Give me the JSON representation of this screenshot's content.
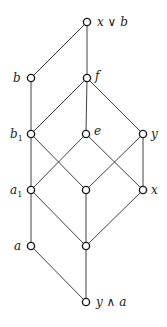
{
  "diagram": {
    "type": "hasse-diagram",
    "nodes": [
      {
        "id": "xvb",
        "label": "x ∨ b",
        "x": 87,
        "y": 22,
        "label_side": "right"
      },
      {
        "id": "b",
        "label": "b",
        "x": 31,
        "y": 78,
        "label_side": "left"
      },
      {
        "id": "f",
        "label": "f",
        "x": 87,
        "y": 78,
        "label_side": "right"
      },
      {
        "id": "b1",
        "label": "b",
        "label_sub": "1",
        "x": 31,
        "y": 134,
        "label_side": "left"
      },
      {
        "id": "e",
        "label": "e",
        "x": 86,
        "y": 134,
        "label_side": "right"
      },
      {
        "id": "y",
        "label": "y",
        "x": 143,
        "y": 134,
        "label_side": "right"
      },
      {
        "id": "a1",
        "label": "a",
        "label_sub": "1",
        "x": 31,
        "y": 190,
        "label_side": "left"
      },
      {
        "id": "m",
        "label": "",
        "x": 86,
        "y": 190,
        "label_side": "none"
      },
      {
        "id": "x",
        "label": "x",
        "x": 143,
        "y": 190,
        "label_side": "right"
      },
      {
        "id": "a",
        "label": "a",
        "x": 31,
        "y": 246,
        "label_side": "left"
      },
      {
        "id": "n",
        "label": "",
        "x": 86,
        "y": 246,
        "label_side": "none"
      },
      {
        "id": "yaa",
        "label": "y ∧ a",
        "x": 86,
        "y": 302,
        "label_side": "right"
      }
    ],
    "edges": [
      [
        "xvb",
        "b"
      ],
      [
        "xvb",
        "f"
      ],
      [
        "b",
        "b1"
      ],
      [
        "f",
        "b1"
      ],
      [
        "f",
        "e"
      ],
      [
        "f",
        "y"
      ],
      [
        "b1",
        "a1"
      ],
      [
        "b1",
        "m"
      ],
      [
        "e",
        "a1"
      ],
      [
        "e",
        "x"
      ],
      [
        "y",
        "m"
      ],
      [
        "y",
        "x"
      ],
      [
        "a1",
        "a"
      ],
      [
        "a1",
        "n"
      ],
      [
        "m",
        "n"
      ],
      [
        "x",
        "n"
      ],
      [
        "a",
        "yaa"
      ],
      [
        "n",
        "yaa"
      ]
    ]
  },
  "labels": {
    "xvb": "x ∨ b",
    "b": "b",
    "f": "f",
    "b1_main": "b",
    "b1_sub": "1",
    "e": "e",
    "y": "y",
    "a1_main": "a",
    "a1_sub": "1",
    "x": "x",
    "a": "a",
    "yaa": "y ∧ a"
  }
}
